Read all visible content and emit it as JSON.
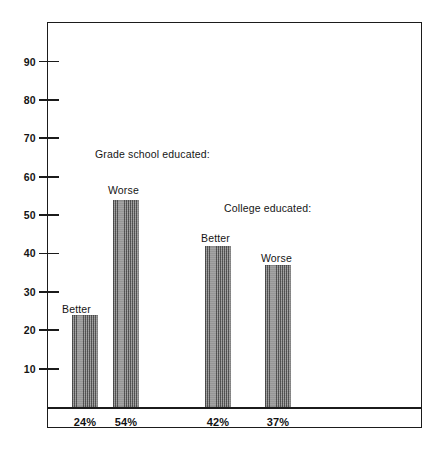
{
  "chart_data": {
    "type": "bar",
    "title": "",
    "xlabel": "",
    "ylabel": "",
    "ylim": [
      0,
      95
    ],
    "grid": false,
    "legend_position": "none",
    "categories": [
      "Better",
      "Worse",
      "Better",
      "Worse"
    ],
    "values": [
      24,
      54,
      42,
      37
    ],
    "value_labels": [
      "24%",
      "54%",
      "42%",
      "37%"
    ],
    "groups": [
      {
        "name": "Grade school educated:",
        "bars": [
          {
            "label": "Better",
            "value": 24,
            "value_label": "24%"
          },
          {
            "label": "Worse",
            "value": 54,
            "value_label": "54%"
          }
        ]
      },
      {
        "name": "College educated:",
        "bars": [
          {
            "label": "Better",
            "value": 42,
            "value_label": "42%"
          },
          {
            "label": "Worse",
            "value": 37,
            "value_label": "37%"
          }
        ]
      }
    ],
    "yticks": [
      10,
      20,
      30,
      40,
      50,
      60,
      70,
      80,
      90
    ],
    "ytick_labels": [
      "10",
      "20",
      "30",
      "40",
      "50",
      "60",
      "70",
      "80",
      "90"
    ],
    "annotations": [
      "Grade school educated:",
      "College educated:"
    ],
    "bar_fill_color": "#8d8d8d",
    "axis_color": "#1b1b1b",
    "background_color": "#ffffff"
  },
  "axis": {
    "ticks": [
      {
        "label": "90",
        "value": 90
      },
      {
        "label": "80",
        "value": 80
      },
      {
        "label": "70",
        "value": 70
      },
      {
        "label": "60",
        "value": 60
      },
      {
        "label": "50",
        "value": 50
      },
      {
        "label": "40",
        "value": 40
      },
      {
        "label": "30",
        "value": 30
      },
      {
        "label": "20",
        "value": 20
      },
      {
        "label": "10",
        "value": 10
      }
    ]
  },
  "annotations": {
    "group_grade_school": "Grade school educated:",
    "group_college": "College educated:",
    "bar1_label": "Better",
    "bar2_label": "Worse",
    "bar3_label": "Better",
    "bar4_label": "Worse"
  },
  "x_values": {
    "bar1": "24%",
    "bar2": "54%",
    "bar3": "42%",
    "bar4": "37%"
  },
  "title": {
    "text": ""
  }
}
